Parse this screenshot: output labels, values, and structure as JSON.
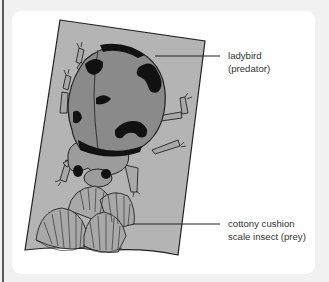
{
  "figure": {
    "labels": [
      {
        "id": "predator",
        "lines": [
          "ladybird",
          "(predator)"
        ]
      },
      {
        "id": "prey",
        "lines": [
          "cottony cushion",
          "scale insect (prey)"
        ]
      }
    ],
    "colors": {
      "page_background": "#f1f1f1",
      "panel": "#ffffff",
      "leaf": "#b4b4b4",
      "ladybird_body": "#8a8a8a",
      "spots": "#111111",
      "scale_insect": "#a8a8a8",
      "leader_line": "#222222",
      "label_text": "#333333"
    }
  }
}
